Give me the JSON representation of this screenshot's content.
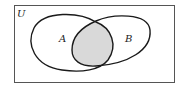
{
  "diagram": {
    "type": "venn",
    "universe_label": "U",
    "sets": [
      {
        "label": "A"
      },
      {
        "label": "B"
      }
    ],
    "shaded_region": "A ∩ B",
    "colors": {
      "outline": "#1a1a1a",
      "universe_border": "#555555",
      "shade": "#d9d9d9",
      "background": "#ffffff"
    }
  }
}
